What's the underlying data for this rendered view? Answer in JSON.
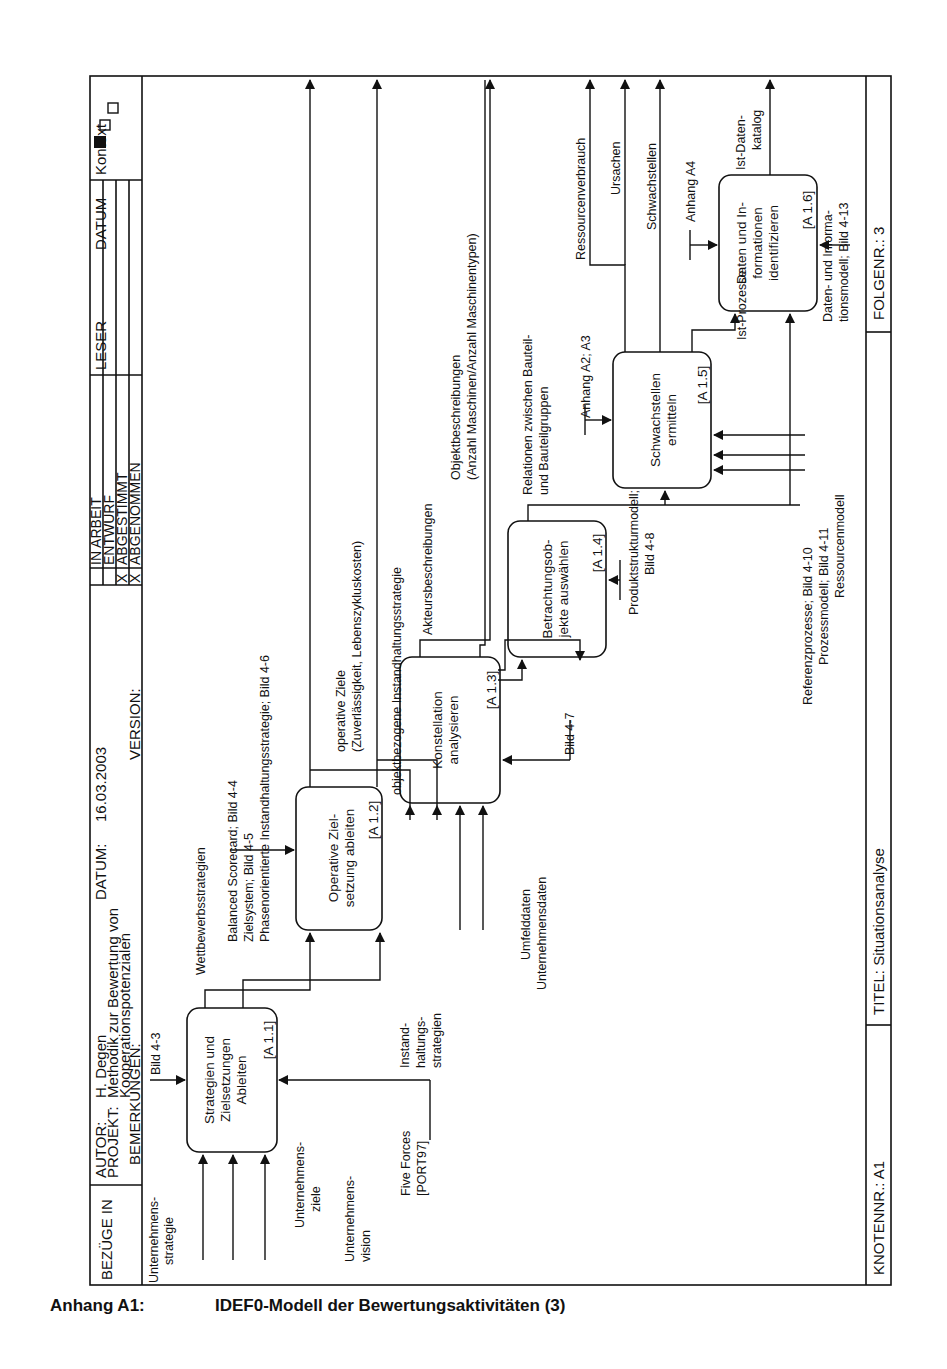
{
  "header": {
    "bezuege_label": "BEZÜGE IN",
    "autor_label": "AUTOR:",
    "autor_value": "H. Degen",
    "datum_label": "DATUM:",
    "datum_value": "16.03.2003",
    "projekt_label": "PROJEKT:",
    "projekt_line1": "Methodik zur Bewertung von",
    "projekt_line2": "Kooperationspotenzialen",
    "bemerkungen_label": "BEMERKUNGEN:",
    "version_label": "VERSION:",
    "status": [
      {
        "label": "IN ARBEIT",
        "mark": ""
      },
      {
        "label": "ENTWURF",
        "mark": ""
      },
      {
        "label": "ABGESTIMMT",
        "mark": "X"
      },
      {
        "label": "ABGENOMMEN",
        "mark": "X"
      }
    ],
    "leser_label": "LESER",
    "datum_col_label": "DATUM",
    "kontext_label": "Kontext"
  },
  "footer": {
    "knotennr": "KNOTENNR.: A1",
    "titel": "TITEL: Situationsanalyse",
    "folgenr": "FOLGENR.: 3"
  },
  "caption": {
    "label": "Anhang A1:",
    "title": "IDEF0-Modell der Bewertungsaktivitäten (3)"
  },
  "activities": [
    {
      "id": "A 1.1",
      "line1": "Strategien und",
      "line2": "Zielsetzungen",
      "line3": "Ableiten",
      "tag": "[A 1.1]"
    },
    {
      "id": "A 1.2",
      "line1": "Operative Ziel-",
      "line2": "setzung ableiten",
      "line3": "",
      "tag": "[A 1.2]"
    },
    {
      "id": "A 1.3",
      "line1": "Konstellation",
      "line2": "analysieren",
      "line3": "",
      "tag": "[A 1.3]"
    },
    {
      "id": "A 1.4",
      "line1": "Betrachtungsob-",
      "line2": "jekte auswählen",
      "line3": "",
      "tag": "[A 1.4]"
    },
    {
      "id": "A 1.5",
      "line1": "Schwachstellen",
      "line2": "ermitteln",
      "line3": "",
      "tag": "[A 1.5]"
    },
    {
      "id": "A 1.6",
      "line1": "Daten und In-",
      "line2": "formationen",
      "line3": "identifizieren",
      "tag": "[A 1.6]"
    }
  ],
  "arrows": {
    "bild_4_3": "Bild 4-3",
    "u_strategie_1": "Unternehmens-",
    "u_strategie_2": "strategie",
    "u_ziele_1": "Unternehmens-",
    "u_ziele_2": "ziele",
    "u_vision_1": "Unternehmens-",
    "u_vision_2": "vision",
    "five_forces_1": "Five Forces",
    "five_forces_2": "[PORT97]",
    "wettbewerb": "Wettbewerbsstrategien",
    "instand_1": "Instand-",
    "instand_2": "haltungs-",
    "instand_3": "strategien",
    "bsc_1": "Balanced Scorecard; Bild 4-4",
    "bsc_2": "Zielsystem; Bild 4-5",
    "bsc_3": "Phasenorientierte Instandhaltungsstrategie; Bild 4-6",
    "op_ziele_1": "operative Ziele",
    "op_ziele_2": "(Zuverlässigkeit, Lebenszykluskosten)",
    "objektbez": "objektbezogene Instandhaltungsstrategie",
    "umfelddaten": "Umfelddaten",
    "unternehmensdaten": "Unternehmensdaten",
    "akteure": "Akteursbeschreibungen",
    "bild_4_7": "Bild 4-7",
    "objektbeschr_1": "Objektbeschreibungen",
    "objektbeschr_2": "(Anzahl Maschinen/Anzahl Maschinentypen)",
    "produkt_1": "Produktstrukturmodell;",
    "produkt_2": "Bild 4-8",
    "relationen_1": "Relationen zwischen Bauteil-",
    "relationen_2": "und Bauteilgruppen",
    "anhang_a2": "Anhang A2; A3",
    "ressourcen": "Ressourcenverbrauch",
    "ursachen": "Ursachen",
    "schwachstellen": "Schwachstellen",
    "referenz": "Referenzprozesse; Bild 4-10",
    "prozessmodell": "Prozessmodell; Bild 4-11",
    "ressourcenmodell": "Ressourcenmodell",
    "ist_prozesse": "Ist-Prozesse",
    "anhang_a4": "Anhang A4",
    "ist_daten_1": "Ist-Daten-",
    "ist_daten_2": "katalog",
    "datenmodell_1": "Daten- und Informa-",
    "datenmodell_2": "tionsmodell; Bild 4-13"
  },
  "colors": {
    "ink": "#111111",
    "paper": "#ffffff"
  }
}
